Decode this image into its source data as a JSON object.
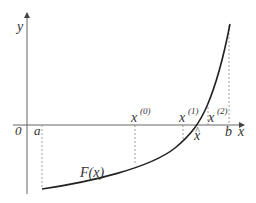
{
  "diagram": {
    "axis_labels": {
      "x": "x",
      "y": "y",
      "origin": "0"
    },
    "function_label": "F(x)",
    "points": {
      "a": "a",
      "b": "b",
      "x0": "x",
      "x0_sup": "(0)",
      "x1": "x",
      "x1_sup": "(1)",
      "x2": "x",
      "x2_sup": "(2)",
      "xhat": "x",
      "xhat_accent": "^"
    },
    "colors": {
      "axis": "#555555",
      "curve": "#222222",
      "dashed": "#888888",
      "text": "#333333"
    }
  }
}
